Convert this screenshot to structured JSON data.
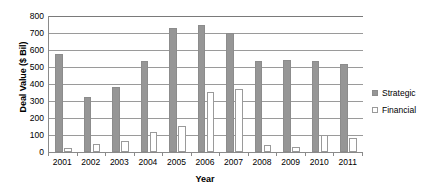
{
  "chart_data": {
    "type": "bar",
    "title": "",
    "xlabel": "Year",
    "ylabel": "Deal Value ($ Bil)",
    "categories": [
      "2001",
      "2002",
      "2003",
      "2004",
      "2005",
      "2006",
      "2007",
      "2008",
      "2009",
      "2010",
      "2011"
    ],
    "series": [
      {
        "name": "Strategic",
        "color": "#969696",
        "values": [
          575,
          325,
          380,
          535,
          730,
          748,
          700,
          535,
          540,
          537,
          515
        ]
      },
      {
        "name": "Financial",
        "color": "#ffffff",
        "values": [
          25,
          48,
          62,
          115,
          155,
          355,
          370,
          42,
          30,
          100,
          80
        ]
      }
    ],
    "ylim": [
      0,
      800
    ],
    "yticks": [
      0,
      100,
      200,
      300,
      400,
      500,
      600,
      700,
      800
    ],
    "ytick_labels": [
      "0",
      "100",
      "200",
      "300",
      "400",
      "500",
      "600",
      "700",
      "800"
    ],
    "grid": true,
    "legend_position": "right"
  },
  "legend": {
    "items": [
      {
        "label": "Strategic",
        "swatch": "filled-gray-square-icon"
      },
      {
        "label": "Financial",
        "swatch": "outlined-white-square-icon"
      }
    ]
  }
}
